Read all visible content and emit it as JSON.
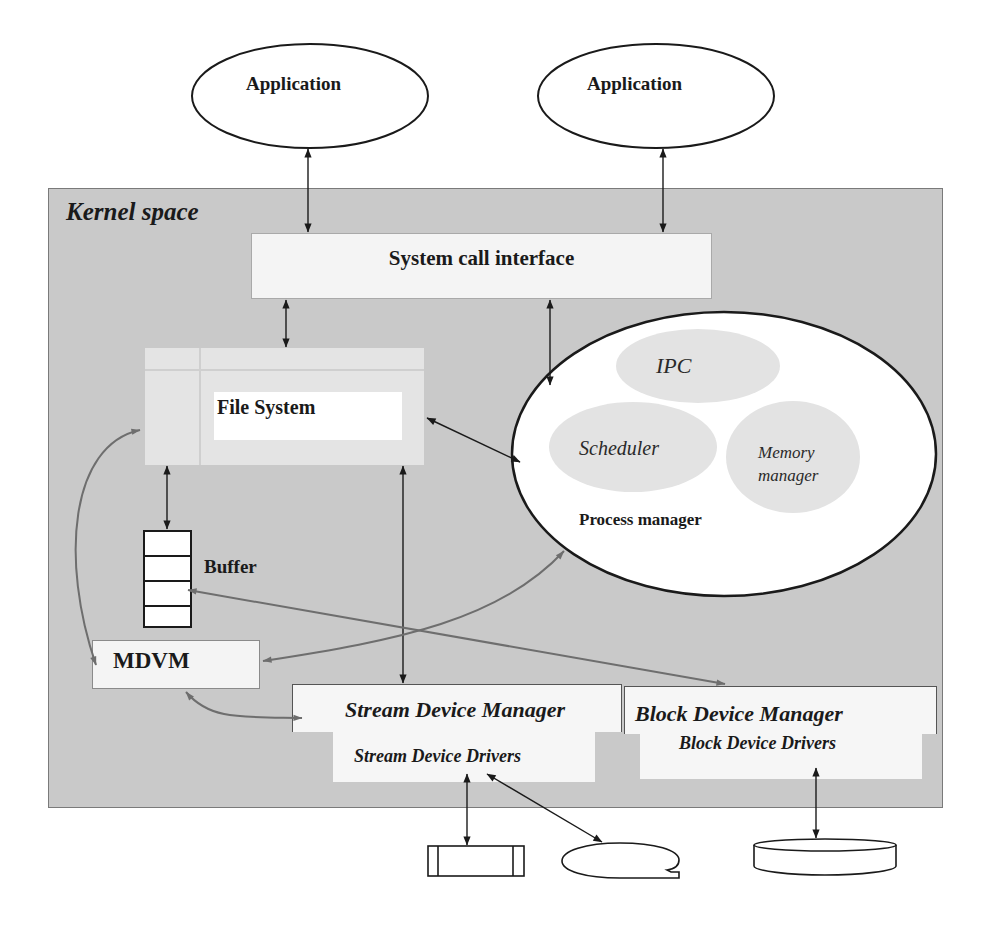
{
  "diagram": {
    "type": "os-kernel-architecture",
    "colors": {
      "kernel_background": "#c9c9c9",
      "box_fill": "#f4f4f4",
      "subcomponent_fill": "#e3e3e3",
      "arrow_black": "#1a1a1a",
      "arrow_gray": "#6e6e6e"
    },
    "user_space": {
      "applications": [
        {
          "label": "Application"
        },
        {
          "label": "Application"
        }
      ]
    },
    "kernel": {
      "label": "Kernel space",
      "system_call_interface": {
        "label": "System call interface"
      },
      "file_system": {
        "label": "File System"
      },
      "buffer": {
        "label": "Buffer",
        "cells": 4
      },
      "mdvm": {
        "label": "MDVM"
      },
      "process_manager": {
        "label": "Process manager",
        "components": [
          {
            "label": "IPC"
          },
          {
            "label": "Scheduler"
          },
          {
            "label_line1": "Memory",
            "label_line2": "manager"
          }
        ]
      },
      "stream_device": {
        "manager_label": "Stream Device Manager",
        "drivers_label": "Stream Device Drivers"
      },
      "block_device": {
        "manager_label": "Block Device Manager",
        "drivers_label": "Block Device Drivers"
      }
    },
    "hardware_devices": [
      {
        "name": "terminal-device",
        "shape": "rectangle-with-side-bars"
      },
      {
        "name": "tape-device",
        "shape": "tape-reel"
      },
      {
        "name": "disk-device",
        "shape": "disk-cylinder"
      }
    ],
    "connections": [
      {
        "from": "Application (left)",
        "to": "System call interface",
        "style": "black",
        "direction": "both"
      },
      {
        "from": "Application (right)",
        "to": "System call interface",
        "style": "black",
        "direction": "both"
      },
      {
        "from": "System call interface",
        "to": "File System",
        "style": "black",
        "direction": "both"
      },
      {
        "from": "System call interface",
        "to": "Process manager",
        "style": "black",
        "direction": "both"
      },
      {
        "from": "File System",
        "to": "Process manager",
        "style": "black",
        "direction": "both"
      },
      {
        "from": "File System",
        "to": "Buffer",
        "style": "black",
        "direction": "both"
      },
      {
        "from": "File System",
        "to": "Stream Device Manager",
        "style": "black",
        "direction": "both"
      },
      {
        "from": "File System",
        "to": "MDVM",
        "style": "gray",
        "direction": "both"
      },
      {
        "from": "Buffer",
        "to": "Block Device Manager",
        "style": "gray",
        "direction": "both"
      },
      {
        "from": "MDVM",
        "to": "Process manager",
        "style": "gray",
        "direction": "both"
      },
      {
        "from": "MDVM",
        "to": "Stream Device Manager",
        "style": "gray",
        "direction": "both"
      },
      {
        "from": "Stream Device Drivers",
        "to": "terminal-device",
        "style": "black",
        "direction": "both"
      },
      {
        "from": "Stream Device Drivers",
        "to": "tape-device",
        "style": "black",
        "direction": "both"
      },
      {
        "from": "Block Device Drivers",
        "to": "disk-device",
        "style": "black",
        "direction": "both"
      }
    ]
  }
}
